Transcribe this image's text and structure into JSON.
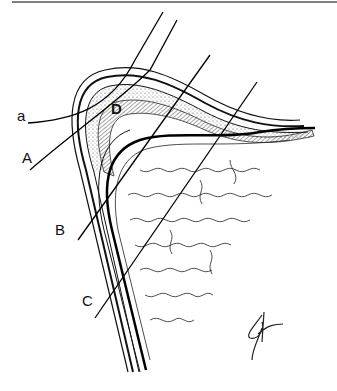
{
  "figure": {
    "type": "anatomical line drawing",
    "labels": [
      {
        "id": "a",
        "text": "a",
        "x": 17,
        "y": 112
      },
      {
        "id": "A",
        "text": "A",
        "x": 22,
        "y": 150
      },
      {
        "id": "D",
        "text": "D",
        "x": 112,
        "y": 104
      },
      {
        "id": "B",
        "text": "B",
        "x": 52,
        "y": 218
      },
      {
        "id": "C",
        "text": "C",
        "x": 82,
        "y": 288
      }
    ],
    "signature": "monogram"
  }
}
